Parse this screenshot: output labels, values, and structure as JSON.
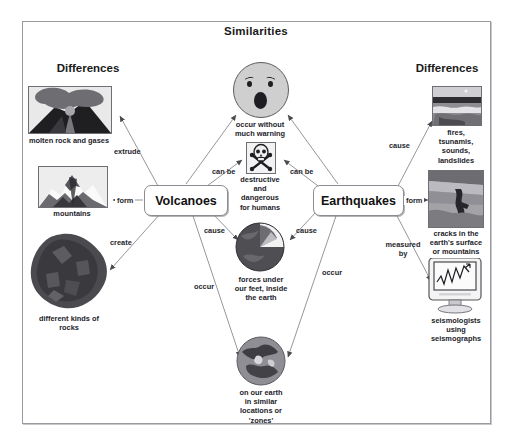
{
  "diagram": {
    "title": "Similarities",
    "left_heading": "Differences",
    "right_heading": "Differences",
    "nodes": {
      "volcanoes": "Volcanoes",
      "earthquakes": "Earthquakes"
    },
    "center_items": [
      {
        "id": "surprised-face",
        "caption": "occur without\nmuch warning",
        "icon": "surprised-face-icon"
      },
      {
        "id": "skull",
        "caption": "destructive\nand\ndangerous\nfor humans",
        "icon": "skull-crossbones-icon"
      },
      {
        "id": "earth-cutaway",
        "caption": "forces under\nour feet, inside\nthe earth",
        "icon": "earth-cutaway-icon"
      },
      {
        "id": "earth-globe",
        "caption": "on our earth\nin similar\nlocations or\n'zones'",
        "icon": "earth-globe-icon"
      }
    ],
    "left_items": [
      {
        "id": "molten-rock",
        "caption": "molten rock and\ngases",
        "icon": "erupting-volcano-photo"
      },
      {
        "id": "mountains",
        "caption": "mountains",
        "icon": "mountain-photo"
      },
      {
        "id": "rocks",
        "caption": "different kinds of\nrocks",
        "icon": "rock-photo"
      }
    ],
    "right_items": [
      {
        "id": "fires",
        "caption": "fires,\ntsunamis,\nsounds,\nlandslides",
        "icon": "tsunami-photo"
      },
      {
        "id": "cracks",
        "caption": "cracks in the\nearth's surface\nor mountains",
        "icon": "ground-crack-photo"
      },
      {
        "id": "seismologists",
        "caption": "seismologists\nusing\nseismographs",
        "icon": "seismograph-monitor-photo"
      }
    ],
    "edge_labels": {
      "extrude": "extrude",
      "form_left": "form",
      "create": "create",
      "can_be_left": "can be",
      "cause_left": "cause",
      "occur_left": "occur",
      "can_be_right": "can be",
      "cause_center_right": "cause",
      "occur_right": "occur",
      "cause_right": "cause",
      "form_right": "form",
      "measured_by": "measured\nby"
    },
    "colors": {
      "frame_border": "#9a9aa0",
      "node_border": "#8c8c92",
      "text": "#1a1a1a",
      "connector": "#8a8a90"
    }
  }
}
